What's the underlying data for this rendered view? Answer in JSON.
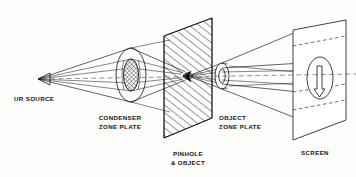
{
  "figure": {
    "kind": "optical-ray-diagram",
    "title_present": false,
    "background_color": "#fdfdfb",
    "ink_color": "#101014",
    "axis_color": "#4a4a50"
  },
  "labels": {
    "source": "UR SOURCE",
    "condenser_zone_plate_line1": "CONDENSER",
    "condenser_zone_plate_line2": "ZONE PLATE",
    "pinhole_line1": "PINHOLE",
    "pinhole_line2": "& OBJECT",
    "object_zone_plate_line1": "OBJECT",
    "object_zone_plate_line2": "ZONE PLATE",
    "screen": "SCREEN"
  },
  "components": [
    {
      "name": "source",
      "label": "UR SOURCE",
      "type": "point-source",
      "x": 38,
      "y": 79
    },
    {
      "name": "condenser-zone-plate",
      "label": "CONDENSER ZONE PLATE",
      "type": "zone-plate-ellipse",
      "cx": 131,
      "cy": 75,
      "rx": 15,
      "ry": 27,
      "inner_rx": 7,
      "inner_ry": 16,
      "inner_shading": "cross-hatch"
    },
    {
      "name": "pinhole-object-plane",
      "label": "PINHOLE & OBJECT",
      "type": "hatched-plane",
      "cx": 188,
      "cy": 76,
      "hatching": "diagonal"
    },
    {
      "name": "object-zone-plate",
      "label": "OBJECT ZONE PLATE",
      "type": "zone-plate-ellipse",
      "cx": 222,
      "cy": 76,
      "rx": 7,
      "ry": 13,
      "inner_rx": 3,
      "inner_ry": 7
    },
    {
      "name": "screen",
      "label": "SCREEN",
      "type": "plane-with-image",
      "cx": 318,
      "cy": 78,
      "image_shape": "arrow-in-ellipse"
    }
  ],
  "optical_axis": {
    "from_x": 38,
    "from_y": 79,
    "to_x": 356,
    "to_y": 74,
    "style": "dashed"
  }
}
